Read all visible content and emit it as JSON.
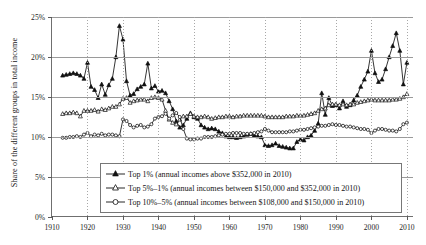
{
  "axes": {
    "ylabel": "Share of the different groups in total income",
    "yticks": [
      "0%",
      "5%",
      "10%",
      "15%",
      "20%",
      "25%"
    ],
    "ytick_values": [
      0,
      5,
      10,
      15,
      20,
      25
    ],
    "xticks": [
      "1910",
      "1920",
      "1930",
      "1940",
      "1950",
      "1960",
      "1970",
      "1980",
      "1990",
      "2000",
      "2010"
    ],
    "xtick_values": [
      1910,
      1920,
      1930,
      1940,
      1950,
      1960,
      1970,
      1980,
      1990,
      2000,
      2010
    ],
    "xlim": [
      1910,
      2012
    ],
    "ylim": [
      0,
      25
    ]
  },
  "legend": {
    "items": [
      {
        "label": "Top 1% (annual incomes above $352,000 in 2010)",
        "marker": "filled-triangle-marker"
      },
      {
        "label": "Top 5%–1% (annual incomes between $150,000 and $352,000 in 2010)",
        "marker": "open-triangle-marker"
      },
      {
        "label": "Top 10%–5% (annual incomes between $108,000 and $150,000 in 2010)",
        "marker": "open-circle-marker"
      }
    ]
  },
  "colors": {
    "line": "#101010",
    "gridline_horizontal": "#9a9a9a",
    "gridline_vertical": "#a8a8a8",
    "axis": "#6f6f6f",
    "background": "#ffffff"
  },
  "chart_data": {
    "type": "line",
    "title": "",
    "xlabel": "",
    "ylabel": "Share of the different groups in total income",
    "xlim": [
      1910,
      2012
    ],
    "ylim": [
      0,
      25
    ],
    "grid": true,
    "legend_position": "lower-center",
    "x": [
      1913,
      1914,
      1915,
      1916,
      1917,
      1918,
      1919,
      1920,
      1921,
      1922,
      1923,
      1924,
      1925,
      1926,
      1927,
      1928,
      1929,
      1930,
      1931,
      1932,
      1933,
      1934,
      1935,
      1936,
      1937,
      1938,
      1939,
      1940,
      1941,
      1942,
      1943,
      1944,
      1945,
      1946,
      1947,
      1948,
      1949,
      1950,
      1951,
      1952,
      1953,
      1954,
      1955,
      1956,
      1957,
      1958,
      1959,
      1960,
      1961,
      1962,
      1963,
      1964,
      1965,
      1966,
      1967,
      1968,
      1969,
      1970,
      1971,
      1972,
      1973,
      1974,
      1975,
      1976,
      1977,
      1978,
      1979,
      1980,
      1981,
      1982,
      1983,
      1984,
      1985,
      1986,
      1987,
      1988,
      1989,
      1990,
      1991,
      1992,
      1993,
      1994,
      1995,
      1996,
      1997,
      1998,
      1999,
      2000,
      2001,
      2002,
      2003,
      2004,
      2005,
      2006,
      2007,
      2008,
      2009,
      2010
    ],
    "series": [
      {
        "name": "Top 1% (annual incomes above $352,000 in 2010)",
        "marker": "filled-triangle",
        "values": [
          17.7,
          17.8,
          17.9,
          18.0,
          17.9,
          17.7,
          17.3,
          19.3,
          16.3,
          15.9,
          14.9,
          16.6,
          15.3,
          16.5,
          17.3,
          20.0,
          23.9,
          22.2,
          17.0,
          15.2,
          15.4,
          16.0,
          16.3,
          16.6,
          19.2,
          16.1,
          16.4,
          15.7,
          15.8,
          15.5,
          14.5,
          13.5,
          12.0,
          11.2,
          11.5,
          12.3,
          13.0,
          12.5,
          12.3,
          11.5,
          11.2,
          11.0,
          11.1,
          11.0,
          10.7,
          10.5,
          10.1,
          10.0,
          10.0,
          9.9,
          10.0,
          10.1,
          10.3,
          10.4,
          10.2,
          10.1,
          10.0,
          9.0,
          8.9,
          9.0,
          9.2,
          8.9,
          8.8,
          8.7,
          8.6,
          8.6,
          9.4,
          9.7,
          9.6,
          10.0,
          10.2,
          10.8,
          11.7,
          15.5,
          12.8,
          14.9,
          13.9,
          14.0,
          13.6,
          14.5,
          13.8,
          14.0,
          14.6,
          15.2,
          16.3,
          17.2,
          18.2,
          20.8,
          18.0,
          16.9,
          17.2,
          18.5,
          20.0,
          21.4,
          23.0,
          20.8,
          16.6,
          19.3
        ]
      },
      {
        "name": "Top 5%–1% (annual incomes between $150,000 and $352,000 in 2010)",
        "marker": "open-triangle",
        "values": [
          12.9,
          13.0,
          13.0,
          13.1,
          13.0,
          12.6,
          13.3,
          13.3,
          13.3,
          13.4,
          13.2,
          13.5,
          13.4,
          13.6,
          13.8,
          13.8,
          14.1,
          14.8,
          14.9,
          14.3,
          14.5,
          14.6,
          14.7,
          14.7,
          14.5,
          14.9,
          15.0,
          14.9,
          14.7,
          13.3,
          12.2,
          11.8,
          11.6,
          12.2,
          12.6,
          12.6,
          12.9,
          12.6,
          12.5,
          12.5,
          12.6,
          12.5,
          12.3,
          12.4,
          12.5,
          12.5,
          12.6,
          12.6,
          12.5,
          12.6,
          12.6,
          12.7,
          12.7,
          12.7,
          12.7,
          12.7,
          12.7,
          12.6,
          12.5,
          12.5,
          12.5,
          12.5,
          12.5,
          12.6,
          12.6,
          12.6,
          12.7,
          12.7,
          12.7,
          12.8,
          12.9,
          13.0,
          13.3,
          13.5,
          13.6,
          14.0,
          14.1,
          14.1,
          14.0,
          14.1,
          14.0,
          14.1,
          14.1,
          14.3,
          14.4,
          14.5,
          14.6,
          14.7,
          14.6,
          14.6,
          14.6,
          14.6,
          14.6,
          14.7,
          14.7,
          14.8,
          15.0,
          15.4
        ]
      },
      {
        "name": "Top 10%–5% (annual incomes between $108,000 and $150,000 in 2010)",
        "marker": "open-circle",
        "values": [
          9.9,
          9.9,
          10.0,
          10.0,
          10.1,
          10.0,
          10.3,
          10.5,
          10.1,
          10.3,
          10.2,
          10.4,
          10.2,
          10.3,
          10.3,
          10.2,
          10.1,
          12.2,
          12.0,
          11.5,
          11.2,
          11.4,
          11.5,
          11.2,
          11.3,
          11.6,
          12.3,
          12.5,
          12.6,
          12.9,
          12.3,
          12.7,
          13.0,
          12.5,
          11.0,
          9.8,
          9.7,
          9.7,
          9.8,
          9.8,
          10.0,
          10.0,
          10.0,
          10.1,
          10.2,
          10.3,
          10.4,
          10.4,
          10.5,
          10.5,
          10.5,
          10.4,
          10.4,
          10.4,
          10.5,
          10.6,
          10.7,
          11.0,
          10.8,
          10.6,
          10.6,
          10.6,
          10.6,
          10.6,
          10.7,
          10.7,
          10.8,
          10.9,
          10.9,
          11.0,
          11.1,
          11.2,
          11.3,
          11.4,
          11.4,
          11.5,
          11.6,
          11.5,
          11.5,
          11.4,
          11.3,
          11.3,
          11.2,
          11.1,
          11.0,
          11.0,
          10.9,
          10.5,
          10.8,
          11.0,
          11.0,
          10.9,
          10.8,
          10.8,
          10.7,
          11.0,
          11.6,
          11.8
        ]
      }
    ]
  }
}
